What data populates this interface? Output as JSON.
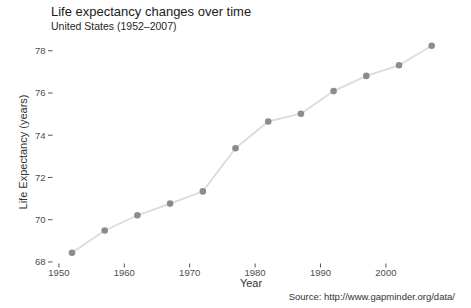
{
  "chart_data": {
    "type": "line",
    "title": "Life expectancy changes over time",
    "subtitle": "United States (1952–2007)",
    "caption": "Source: http://www.gapminder.org/data/",
    "xlabel": "Year",
    "ylabel": "Life Expectancy (years)",
    "series_name": "United States",
    "x": [
      1952,
      1957,
      1962,
      1967,
      1972,
      1977,
      1982,
      1987,
      1992,
      1997,
      2002,
      2007
    ],
    "values": [
      68.44,
      69.49,
      70.21,
      70.76,
      71.34,
      73.38,
      74.65,
      75.02,
      76.09,
      76.81,
      77.31,
      78.24
    ],
    "xticks": [
      1950,
      1960,
      1970,
      1980,
      1990,
      2000
    ],
    "yticks": [
      68,
      70,
      72,
      74,
      76,
      78
    ],
    "xlim": [
      1949.1,
      2009.8
    ],
    "ylim": [
      67.95,
      78.65
    ],
    "grid": false,
    "legend": "none",
    "colors": {
      "point": "#8c8c8c",
      "line": "#dcdcdc",
      "tick": "#555555",
      "tick_label": "#4d4d4d",
      "background": "#ffffff"
    }
  }
}
